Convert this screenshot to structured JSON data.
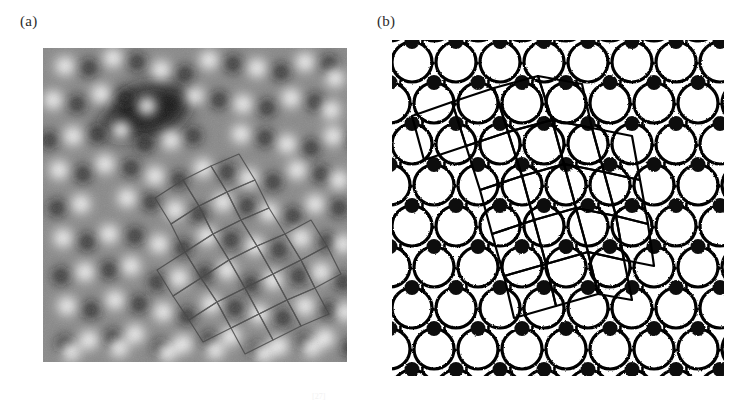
{
  "figure": {
    "type": "two-panel scientific figure",
    "background_color": "#ffffff",
    "panels": [
      {
        "id": "a",
        "label": "(a)",
        "kind": "stm-micrograph"
      },
      {
        "id": "b",
        "label": "(b)",
        "kind": "structure-model"
      }
    ],
    "caption_mark": "[27]"
  },
  "panel_a": {
    "label": "(a)",
    "description": "Grayscale STM image of a quasicrystalline surface showing bright protrusions, a dark depression region, and a rhombic tiling overlay",
    "frame": {
      "x": 43,
      "y": 48,
      "width": 304,
      "height": 314
    },
    "colors": {
      "background_gray": "#8a8a8a",
      "bright_spot": "#f2f2f2",
      "dark_spot": "#1a1a1a",
      "depression": "#171717",
      "overlay_line": "#4a4a4a"
    },
    "bright_spots": [
      [
        22,
        18
      ],
      [
        70,
        10
      ],
      [
        118,
        22
      ],
      [
        166,
        12
      ],
      [
        214,
        20
      ],
      [
        262,
        14
      ],
      [
        292,
        30
      ],
      [
        10,
        52
      ],
      [
        58,
        46
      ],
      [
        104,
        58
      ],
      [
        152,
        48
      ],
      [
        200,
        56
      ],
      [
        248,
        50
      ],
      [
        288,
        62
      ],
      [
        30,
        88
      ],
      [
        78,
        82
      ],
      [
        128,
        92
      ],
      [
        198,
        86
      ],
      [
        244,
        96
      ],
      [
        290,
        88
      ],
      [
        16,
        122
      ],
      [
        62,
        116
      ],
      [
        112,
        128
      ],
      [
        160,
        120
      ],
      [
        206,
        130
      ],
      [
        254,
        122
      ],
      [
        296,
        132
      ],
      [
        38,
        156
      ],
      [
        84,
        150
      ],
      [
        132,
        162
      ],
      [
        180,
        154
      ],
      [
        226,
        164
      ],
      [
        272,
        156
      ],
      [
        20,
        190
      ],
      [
        66,
        186
      ],
      [
        116,
        196
      ],
      [
        164,
        188
      ],
      [
        212,
        198
      ],
      [
        258,
        190
      ],
      [
        300,
        196
      ],
      [
        42,
        224
      ],
      [
        88,
        218
      ],
      [
        136,
        230
      ],
      [
        184,
        222
      ],
      [
        230,
        232
      ],
      [
        278,
        224
      ],
      [
        24,
        258
      ],
      [
        72,
        252
      ],
      [
        120,
        264
      ],
      [
        168,
        256
      ],
      [
        216,
        266
      ],
      [
        262,
        258
      ],
      [
        302,
        264
      ],
      [
        46,
        292
      ],
      [
        92,
        286
      ],
      [
        140,
        296
      ],
      [
        188,
        288
      ],
      [
        236,
        298
      ],
      [
        282,
        290
      ],
      [
        28,
        304
      ],
      [
        76,
        300
      ],
      [
        124,
        305
      ],
      [
        172,
        302
      ],
      [
        220,
        306
      ],
      [
        268,
        300
      ]
    ],
    "dark_spots": [
      [
        46,
        20
      ],
      [
        94,
        14
      ],
      [
        142,
        26
      ],
      [
        190,
        16
      ],
      [
        238,
        24
      ],
      [
        286,
        16
      ],
      [
        34,
        56
      ],
      [
        82,
        50
      ],
      [
        176,
        52
      ],
      [
        224,
        60
      ],
      [
        272,
        54
      ],
      [
        6,
        92
      ],
      [
        54,
        86
      ],
      [
        102,
        96
      ],
      [
        150,
        88
      ],
      [
        222,
        90
      ],
      [
        268,
        100
      ],
      [
        312,
        92
      ],
      [
        40,
        126
      ],
      [
        88,
        120
      ],
      [
        136,
        132
      ],
      [
        184,
        124
      ],
      [
        230,
        134
      ],
      [
        278,
        126
      ],
      [
        14,
        160
      ],
      [
        108,
        154
      ],
      [
        156,
        166
      ],
      [
        204,
        158
      ],
      [
        250,
        168
      ],
      [
        296,
        160
      ],
      [
        44,
        194
      ],
      [
        92,
        188
      ],
      [
        140,
        200
      ],
      [
        188,
        192
      ],
      [
        236,
        202
      ],
      [
        284,
        194
      ],
      [
        18,
        228
      ],
      [
        66,
        222
      ],
      [
        114,
        234
      ],
      [
        162,
        226
      ],
      [
        208,
        236
      ],
      [
        256,
        228
      ],
      [
        300,
        234
      ],
      [
        48,
        262
      ],
      [
        96,
        256
      ],
      [
        144,
        268
      ],
      [
        192,
        260
      ],
      [
        240,
        270
      ],
      [
        286,
        262
      ],
      [
        22,
        296
      ],
      [
        70,
        290
      ],
      [
        118,
        300
      ],
      [
        166,
        292
      ],
      [
        214,
        302
      ],
      [
        262,
        294
      ],
      [
        308,
        300
      ]
    ],
    "depression": {
      "cx": 106,
      "cy": 62,
      "rx": 40,
      "ry": 26,
      "rotate": -12
    },
    "overlay_tiling": {
      "stroke": "#4a4a4a",
      "stroke_width": 1.2,
      "polygons": [
        [
          [
            168,
            118
          ],
          [
            196,
            106
          ],
          [
            212,
            132
          ],
          [
            184,
            144
          ]
        ],
        [
          [
            184,
            144
          ],
          [
            212,
            132
          ],
          [
            226,
            160
          ],
          [
            198,
            172
          ]
        ],
        [
          [
            140,
            132
          ],
          [
            168,
            118
          ],
          [
            184,
            144
          ],
          [
            156,
            158
          ]
        ],
        [
          [
            156,
            158
          ],
          [
            184,
            144
          ],
          [
            198,
            172
          ],
          [
            170,
            186
          ]
        ],
        [
          [
            112,
            150
          ],
          [
            140,
            132
          ],
          [
            156,
            158
          ],
          [
            128,
            176
          ]
        ],
        [
          [
            128,
            176
          ],
          [
            156,
            158
          ],
          [
            170,
            186
          ],
          [
            142,
            204
          ]
        ],
        [
          [
            198,
            172
          ],
          [
            226,
            160
          ],
          [
            242,
            186
          ],
          [
            214,
            198
          ]
        ],
        [
          [
            170,
            186
          ],
          [
            198,
            172
          ],
          [
            214,
            198
          ],
          [
            186,
            212
          ]
        ],
        [
          [
            142,
            204
          ],
          [
            170,
            186
          ],
          [
            186,
            212
          ],
          [
            158,
            230
          ]
        ],
        [
          [
            114,
            222
          ],
          [
            142,
            204
          ],
          [
            158,
            230
          ],
          [
            130,
            248
          ]
        ],
        [
          [
            186,
            212
          ],
          [
            214,
            198
          ],
          [
            230,
            226
          ],
          [
            202,
            240
          ]
        ],
        [
          [
            158,
            230
          ],
          [
            186,
            212
          ],
          [
            202,
            240
          ],
          [
            174,
            254
          ]
        ],
        [
          [
            130,
            248
          ],
          [
            158,
            230
          ],
          [
            174,
            254
          ],
          [
            146,
            272
          ]
        ],
        [
          [
            214,
            198
          ],
          [
            242,
            186
          ],
          [
            258,
            212
          ],
          [
            230,
            226
          ]
        ],
        [
          [
            230,
            226
          ],
          [
            258,
            212
          ],
          [
            272,
            240
          ],
          [
            244,
            252
          ]
        ],
        [
          [
            202,
            240
          ],
          [
            230,
            226
          ],
          [
            244,
            252
          ],
          [
            216,
            266
          ]
        ],
        [
          [
            174,
            254
          ],
          [
            202,
            240
          ],
          [
            216,
            266
          ],
          [
            188,
            280
          ]
        ],
        [
          [
            146,
            272
          ],
          [
            174,
            254
          ],
          [
            188,
            280
          ],
          [
            160,
            294
          ]
        ],
        [
          [
            242,
            186
          ],
          [
            268,
            172
          ],
          [
            284,
            198
          ],
          [
            258,
            212
          ]
        ],
        [
          [
            258,
            212
          ],
          [
            284,
            198
          ],
          [
            298,
            226
          ],
          [
            272,
            240
          ]
        ],
        [
          [
            244,
            252
          ],
          [
            272,
            240
          ],
          [
            286,
            266
          ],
          [
            258,
            278
          ]
        ],
        [
          [
            216,
            266
          ],
          [
            244,
            252
          ],
          [
            258,
            278
          ],
          [
            230,
            292
          ]
        ],
        [
          [
            188,
            280
          ],
          [
            216,
            266
          ],
          [
            230,
            292
          ],
          [
            202,
            306
          ]
        ]
      ]
    }
  },
  "panel_b": {
    "label": "(b)",
    "description": "Structural model: large open circles (surface atoms) in offset rows, small filled circles (interstitial atoms), dashed partial arcs (subsurface atoms) and a central rhombic tiling overlay",
    "frame": {
      "x": 392,
      "y": 40,
      "width": 332,
      "height": 336
    },
    "colors": {
      "open_circle_stroke": "#000000",
      "open_circle_fill": "#ffffff",
      "filled_circle_fill": "#111111",
      "dashed_arc_stroke": "#000000",
      "overlay_line": "#000000"
    },
    "geometry": {
      "open_circle_radius": 20,
      "filled_circle_radius": 7.5,
      "row_spacing": 41,
      "column_spacing": 44,
      "row_offset": 22,
      "rows": 8,
      "columns": 8
    },
    "overlay_tiling": {
      "stroke": "#000000",
      "stroke_width": 2.2,
      "polygons": [
        [
          [
            102,
            48
          ],
          [
            146,
            36
          ],
          [
            160,
            80
          ],
          [
            116,
            92
          ]
        ],
        [
          [
            146,
            36
          ],
          [
            190,
            44
          ],
          [
            200,
            88
          ],
          [
            160,
            80
          ]
        ],
        [
          [
            60,
            62
          ],
          [
            102,
            48
          ],
          [
            116,
            92
          ],
          [
            74,
            106
          ]
        ],
        [
          [
            116,
            92
          ],
          [
            160,
            80
          ],
          [
            172,
            124
          ],
          [
            130,
            136
          ]
        ],
        [
          [
            160,
            80
          ],
          [
            200,
            88
          ],
          [
            212,
            132
          ],
          [
            172,
            124
          ]
        ],
        [
          [
            74,
            106
          ],
          [
            116,
            92
          ],
          [
            130,
            136
          ],
          [
            88,
            150
          ]
        ],
        [
          [
            130,
            136
          ],
          [
            172,
            124
          ],
          [
            184,
            168
          ],
          [
            142,
            180
          ]
        ],
        [
          [
            172,
            124
          ],
          [
            212,
            132
          ],
          [
            224,
            176
          ],
          [
            184,
            168
          ]
        ],
        [
          [
            88,
            150
          ],
          [
            130,
            136
          ],
          [
            142,
            180
          ],
          [
            100,
            194
          ]
        ],
        [
          [
            142,
            180
          ],
          [
            184,
            168
          ],
          [
            196,
            212
          ],
          [
            154,
            224
          ]
        ],
        [
          [
            184,
            168
          ],
          [
            224,
            176
          ],
          [
            232,
            220
          ],
          [
            196,
            212
          ]
        ],
        [
          [
            100,
            194
          ],
          [
            142,
            180
          ],
          [
            154,
            224
          ],
          [
            112,
            236
          ]
        ],
        [
          [
            154,
            224
          ],
          [
            196,
            212
          ],
          [
            206,
            254
          ],
          [
            164,
            266
          ]
        ],
        [
          [
            112,
            236
          ],
          [
            154,
            224
          ],
          [
            164,
            266
          ],
          [
            122,
            278
          ]
        ],
        [
          [
            196,
            212
          ],
          [
            232,
            220
          ],
          [
            240,
            260
          ],
          [
            206,
            254
          ]
        ],
        [
          [
            60,
            62
          ],
          [
            74,
            106
          ],
          [
            32,
            120
          ],
          [
            20,
            76
          ]
        ],
        [
          [
            200,
            88
          ],
          [
            240,
            96
          ],
          [
            248,
            140
          ],
          [
            212,
            132
          ]
        ],
        [
          [
            212,
            132
          ],
          [
            248,
            140
          ],
          [
            256,
            184
          ],
          [
            224,
            176
          ]
        ],
        [
          [
            224,
            176
          ],
          [
            256,
            184
          ],
          [
            262,
            226
          ],
          [
            232,
            220
          ]
        ]
      ]
    }
  }
}
